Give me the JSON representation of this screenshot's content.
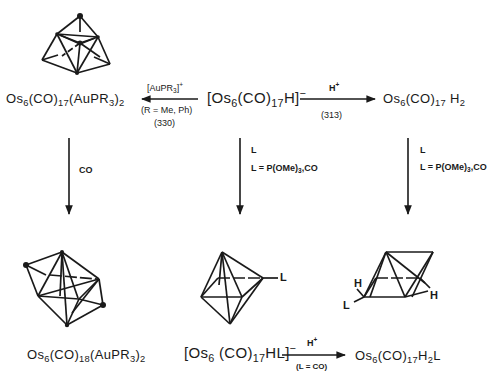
{
  "diagram": {
    "type": "reaction-scheme",
    "compounds": {
      "top_left": {
        "main": "Os",
        "n1": "6",
        "a": "(CO)",
        "n2": "17",
        "b": "(AuPR",
        "n3": "3",
        "c": ")",
        "n4": "2"
      },
      "top_center": {
        "open": "[Os",
        "n1": "6",
        "a": "(CO)",
        "n2": "17",
        "b": "H]",
        "charge": "−"
      },
      "top_right": {
        "main": "Os",
        "n1": "6",
        "a": "(CO)",
        "n2": "17",
        "b": " H",
        "n3": "2"
      },
      "bottom_left": {
        "main": "Os",
        "n1": "6",
        "a": "(CO)",
        "n2": "18",
        "b": "(AuPR",
        "n3": "3",
        "c": ")",
        "n4": "2"
      },
      "bottom_center": {
        "open": "[Os",
        "n1": "6",
        "a": " (CO)",
        "n2": "17",
        "b": "HL]",
        "charge": "−"
      },
      "bottom_right": {
        "main": "Os",
        "n1": "6",
        "a": "(CO)",
        "n2": "17",
        "b": "H",
        "n3": "2",
        "c": "L"
      }
    },
    "arrows": {
      "center_to_left": {
        "reagent": "[AuPR",
        "reagent_sub": "3",
        "reagent_close": "]",
        "reagent_charge": "+",
        "condition": "(R = Me, Ph)",
        "ref": "(330)"
      },
      "center_to_right": {
        "reagent": "H",
        "reagent_charge": "+",
        "ref": "(313)"
      },
      "left_down": {
        "reagent": "CO"
      },
      "center_down": {
        "reagent": "L",
        "condition_a": "L = P(OMe)",
        "condition_sub": "3",
        "condition_b": ",CO"
      },
      "right_down": {
        "reagent": "L",
        "condition_a": "L = P(OMe)",
        "condition_sub": "3",
        "condition_b": ",CO"
      },
      "bottom_center_to_right": {
        "reagent": "H",
        "reagent_charge": "+",
        "condition": "(L = CO)"
      }
    },
    "structure_labels": {
      "center_ligand": "L",
      "right_h1": "H",
      "right_h2": "H",
      "right_l": "L"
    },
    "colors": {
      "ink": "#1a1a1a",
      "background": "#ffffff"
    }
  }
}
